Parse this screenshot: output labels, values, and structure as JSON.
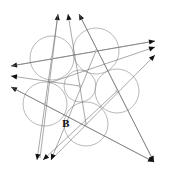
{
  "diagram": {
    "labels": [
      {
        "id": "B",
        "text": "B"
      }
    ],
    "circle_count": 6,
    "line_count": 14,
    "colors": {
      "circle_stroke": "#9a9a9a",
      "line_stroke": "#6e6e6e",
      "arrowhead": "#111111",
      "background": "#ffffff"
    }
  }
}
